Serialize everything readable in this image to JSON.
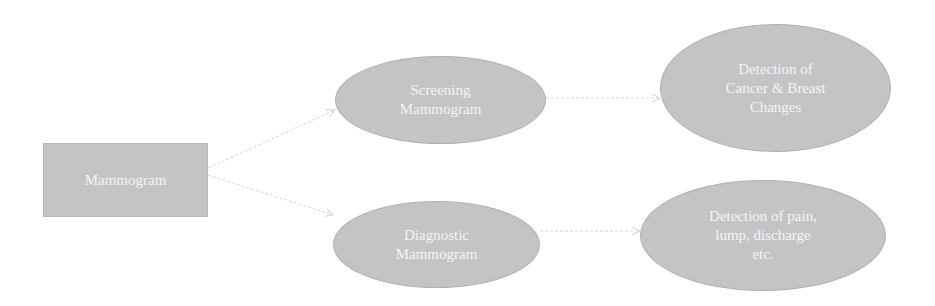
{
  "diagram": {
    "nodes": {
      "root": {
        "label": "Mammogram"
      },
      "screening": {
        "label": "Screening\nMammogram"
      },
      "diagnostic": {
        "label": "Diagnostic\nMammogram"
      },
      "screening_result": {
        "label": "Detection of\nCancer & Breast\nChanges"
      },
      "diagnostic_result": {
        "label": "Detection of pain,\nlump, discharge\netc."
      }
    },
    "edges": [
      {
        "from": "Mammogram",
        "to": "Screening Mammogram"
      },
      {
        "from": "Mammogram",
        "to": "Diagnostic Mammogram"
      },
      {
        "from": "Screening Mammogram",
        "to": "Detection of Cancer & Breast Changes"
      },
      {
        "from": "Diagnostic Mammogram",
        "to": "Detection of pain, lump, discharge etc."
      }
    ],
    "colors": {
      "node_fill": "#c4c4c4",
      "node_text": "#f4f4f4",
      "edge": "#d0d0d0"
    }
  }
}
